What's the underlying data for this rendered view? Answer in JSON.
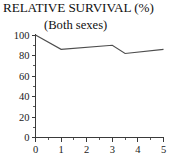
{
  "chart_data": {
    "type": "line",
    "title": "RELATIVE SURVIVAL (%)",
    "subtitle": "(Both sexes)",
    "xlabel": "",
    "ylabel": "",
    "xlim": [
      0,
      5
    ],
    "ylim": [
      0,
      100
    ],
    "grid": false,
    "legend": null,
    "x_ticks": [
      "0",
      "1",
      "2",
      "3",
      "4",
      "5"
    ],
    "x_tick_values": [
      0,
      1,
      2,
      3,
      4,
      5
    ],
    "x_minor_tick_values": [
      0.5,
      1.5,
      2.5,
      3.5,
      4.5
    ],
    "y_ticks": [
      "0",
      "20",
      "40",
      "60",
      "80",
      "100"
    ],
    "y_tick_values": [
      0,
      20,
      40,
      60,
      80,
      100
    ],
    "y_minor_tick_values": [
      10,
      30,
      50,
      70,
      90
    ],
    "series": [
      {
        "name": "Relative survival",
        "color": "#4d4d4d",
        "x": [
          0,
          1,
          3,
          3.5,
          5
        ],
        "values": [
          100,
          86,
          90,
          82,
          86
        ]
      }
    ]
  },
  "figure": {
    "title": "RELATIVE SURVIVAL (%)",
    "subtitle": "(Both sexes)"
  }
}
